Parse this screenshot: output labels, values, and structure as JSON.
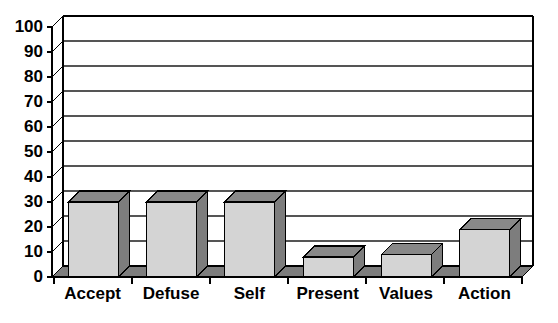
{
  "chart_data": {
    "type": "bar",
    "title": "",
    "subtitle": "",
    "xlabel": "",
    "ylabel": "",
    "categories": [
      "Accept",
      "Defuse",
      "Self",
      "Present",
      "Values",
      "Action"
    ],
    "values": [
      30,
      30,
      30,
      8,
      9,
      19
    ],
    "series": [
      {
        "name": "",
        "values": [
          30,
          30,
          30,
          8,
          9,
          19
        ]
      }
    ],
    "ylim": [
      0,
      100
    ],
    "yticks": [
      0,
      10,
      20,
      30,
      40,
      50,
      60,
      70,
      80,
      90,
      100
    ],
    "ytick_labels": [
      "0",
      "10",
      "20",
      "30",
      "40",
      "50",
      "60",
      "70",
      "80",
      "90",
      "100"
    ],
    "grid": true,
    "grid_axis": "y",
    "legend": false,
    "legend_position": "none",
    "style": "3d",
    "colors": {
      "bar_front": "#d4d4d4",
      "bar_top": "#888888",
      "bar_side": "#7d7d7d",
      "floor": "#7d7d7d",
      "outline": "#000000",
      "gridline": "#555555",
      "axis": "#000000",
      "background": "#ffffff",
      "text": "#000000"
    }
  }
}
